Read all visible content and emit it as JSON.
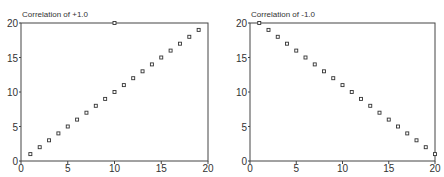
{
  "chart_data": [
    {
      "type": "scatter",
      "title": "Correlation of +1.0",
      "xlabel": "",
      "ylabel": "",
      "xlim": [
        0,
        20
      ],
      "ylim": [
        0,
        20
      ],
      "xticks": [
        0,
        5,
        10,
        15,
        20
      ],
      "yticks": [
        0,
        5,
        10,
        15,
        20
      ],
      "grid": false,
      "x": [
        1,
        2,
        3,
        4,
        5,
        6,
        7,
        8,
        9,
        10,
        11,
        12,
        13,
        14,
        15,
        16,
        17,
        18,
        19
      ],
      "y": [
        1,
        2,
        3,
        4,
        5,
        6,
        7,
        8,
        9,
        10,
        11,
        12,
        13,
        14,
        15,
        16,
        17,
        18,
        19
      ],
      "extra_points": [
        [
          10,
          20
        ]
      ]
    },
    {
      "type": "scatter",
      "title": "Correlation of -1.0",
      "xlabel": "",
      "ylabel": "",
      "xlim": [
        0,
        20
      ],
      "ylim": [
        0,
        20
      ],
      "xticks": [
        0,
        5,
        10,
        15,
        20
      ],
      "yticks": [
        0,
        5,
        10,
        15,
        20
      ],
      "grid": false,
      "x": [
        1,
        2,
        3,
        4,
        5,
        6,
        7,
        8,
        9,
        10,
        11,
        12,
        13,
        14,
        15,
        16,
        17,
        18,
        19,
        20
      ],
      "y": [
        20,
        19,
        18,
        17,
        16,
        15,
        14,
        13,
        12,
        11,
        10,
        9,
        8,
        7,
        6,
        5,
        4,
        3,
        2,
        1
      ]
    }
  ],
  "charts": [
    {
      "title": "Correlation of +1.0"
    },
    {
      "title": "Correlation of -1.0"
    }
  ]
}
